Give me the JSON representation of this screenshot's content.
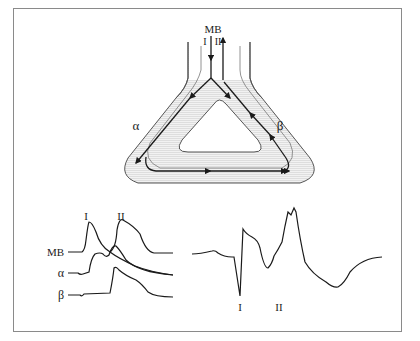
{
  "diagram": {
    "top": {
      "inlet_label": "MB",
      "inlet_path_labels": [
        "I",
        "II"
      ],
      "left_limb_label": "α",
      "right_limb_label": "β"
    },
    "left_traces": {
      "peak_labels": [
        "I",
        "II"
      ],
      "trace_labels": [
        "MB",
        "α",
        "β"
      ]
    },
    "right_trace": {
      "deflection_labels": [
        "I",
        "II"
      ]
    },
    "colors": {
      "line": "#1a1a1a",
      "shading": "#e6e6e6",
      "frame": "#8a8a8a"
    }
  }
}
